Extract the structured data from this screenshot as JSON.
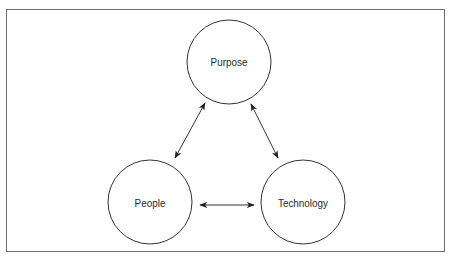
{
  "diagram": {
    "title": "",
    "frame": {
      "x": 6,
      "y": 9,
      "width": 439,
      "height": 243,
      "stroke": "#6e6e6e"
    },
    "style": {
      "stroke": "#333333",
      "fill": "#ffffff",
      "text": "#2a2a2a"
    },
    "nodes": [
      {
        "id": "purpose",
        "label": "Purpose",
        "shape": "circle",
        "cx": 229,
        "cy": 62,
        "r": 42
      },
      {
        "id": "people",
        "label": "People",
        "shape": "circle",
        "cx": 150,
        "cy": 202,
        "r": 42
      },
      {
        "id": "technology",
        "label": "Technology",
        "shape": "circle",
        "cx": 303,
        "cy": 202,
        "r": 42
      }
    ],
    "edges": [
      {
        "from": "purpose",
        "to": "people",
        "direction": "bidirectional",
        "x1": 205,
        "y1": 103,
        "x2": 175,
        "y2": 158
      },
      {
        "from": "purpose",
        "to": "technology",
        "direction": "bidirectional",
        "x1": 251,
        "y1": 104,
        "x2": 278,
        "y2": 158
      },
      {
        "from": "people",
        "to": "technology",
        "direction": "bidirectional",
        "x1": 200,
        "y1": 205,
        "x2": 254,
        "y2": 205
      }
    ]
  }
}
